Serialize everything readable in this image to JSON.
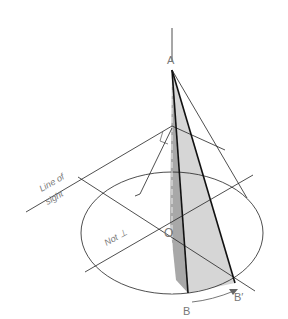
{
  "labels": {
    "apex": "A",
    "center": "O",
    "point_b": "B",
    "point_b_prime": "B′",
    "line_of_sight_1": "Line of",
    "line_of_sight_2": "sight",
    "not_perp": "Not ⊥"
  },
  "colors": {
    "line": "#222222",
    "shade_light": "#d6d6d6",
    "shade_dark": "#a8a8a8",
    "label": "#777777"
  }
}
